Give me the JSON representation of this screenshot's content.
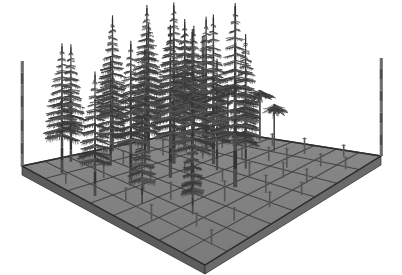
{
  "figure": {
    "background_color": "#ffffff",
    "view": "oblique / isometric-style perspective from above and in front",
    "render_style": "monochrome grayscale wireframe-shaded 3D stand model"
  },
  "colors": {
    "background": "#ffffff",
    "ground_top": "#7a7a7a",
    "ground_top_far": "#8a8a8a",
    "ground_edge_left": "#5c5c5c",
    "ground_edge_right": "#6a6a6a",
    "grid_line": "#3f3f3f",
    "plot_outline": "#2e2e2e",
    "trunk": "#4a4a4a",
    "trunk_dark": "#333333",
    "branch": "#3a3a3a",
    "branch_light": "#565656",
    "corner_post": "#6f6f6f",
    "corner_post_dark": "#4d4d4d",
    "sapling": "#555555"
  },
  "ground_plot": {
    "label": "forest ground plot",
    "shape": "square",
    "grid_columns": 8,
    "grid_rows": 8,
    "grid_cells_total": 64,
    "slab_thickness_px": 9,
    "corners_px": {
      "left": [
        22,
        166
      ],
      "top": [
        203,
        128
      ],
      "right": [
        381,
        156
      ],
      "front": [
        205,
        265
      ]
    }
  },
  "corner_posts": {
    "label": "plot corner marker posts",
    "count": 4,
    "visible_count": 3,
    "height_px": 105,
    "items": [
      {
        "name": "post-left",
        "x": 22,
        "base_y": 166,
        "height": 105
      },
      {
        "name": "post-back",
        "x": 203,
        "base_y": 128,
        "height": 92
      },
      {
        "name": "post-right",
        "x": 381,
        "base_y": 156,
        "height": 98
      }
    ]
  },
  "legend_text": [],
  "axis_labels": [],
  "chart_data": {
    "type": "scatter",
    "xlabel": "",
    "ylabel": "",
    "grid": true,
    "legend": "none",
    "height_classes": [
      {
        "class": "canopy",
        "label": "canopy conifer",
        "count": 17,
        "relative_height": 1.0
      },
      {
        "class": "sub-canopy",
        "label": "sub-canopy tree",
        "count": 9,
        "relative_height": 0.55
      },
      {
        "class": "sapling",
        "label": "sapling stem",
        "count": 34,
        "relative_height": 0.12
      }
    ],
    "trees": [
      {
        "id": 1,
        "gx": 0.1,
        "gy": 0.12,
        "height": 150,
        "crown_w": 52,
        "whorls": 15,
        "form": "conifer"
      },
      {
        "id": 2,
        "gx": 0.22,
        "gy": 0.05,
        "height": 138,
        "crown_w": 46,
        "whorls": 14,
        "form": "conifer"
      },
      {
        "id": 3,
        "gx": 0.33,
        "gy": 0.16,
        "height": 122,
        "crown_w": 42,
        "whorls": 13,
        "form": "conifer"
      },
      {
        "id": 4,
        "gx": 0.46,
        "gy": 0.04,
        "height": 158,
        "crown_w": 50,
        "whorls": 16,
        "form": "conifer"
      },
      {
        "id": 5,
        "gx": 0.56,
        "gy": 0.14,
        "height": 145,
        "crown_w": 46,
        "whorls": 15,
        "form": "conifer"
      },
      {
        "id": 6,
        "gx": 0.66,
        "gy": 0.03,
        "height": 162,
        "crown_w": 54,
        "whorls": 16,
        "form": "conifer"
      },
      {
        "id": 7,
        "gx": 0.78,
        "gy": 0.12,
        "height": 140,
        "crown_w": 48,
        "whorls": 14,
        "form": "conifer"
      },
      {
        "id": 8,
        "gx": 0.88,
        "gy": 0.07,
        "height": 128,
        "crown_w": 44,
        "whorls": 13,
        "form": "conifer"
      },
      {
        "id": 9,
        "gx": 0.06,
        "gy": 0.34,
        "height": 132,
        "crown_w": 44,
        "whorls": 13,
        "form": "conifer"
      },
      {
        "id": 10,
        "gx": 0.28,
        "gy": 0.32,
        "height": 148,
        "crown_w": 48,
        "whorls": 15,
        "form": "conifer"
      },
      {
        "id": 11,
        "gx": 0.42,
        "gy": 0.4,
        "height": 156,
        "crown_w": 50,
        "whorls": 16,
        "form": "conifer"
      },
      {
        "id": 12,
        "gx": 0.54,
        "gy": 0.3,
        "height": 170,
        "crown_w": 56,
        "whorls": 17,
        "form": "conifer"
      },
      {
        "id": 13,
        "gx": 0.64,
        "gy": 0.42,
        "height": 152,
        "crown_w": 48,
        "whorls": 15,
        "form": "conifer"
      },
      {
        "id": 14,
        "gx": 0.74,
        "gy": 0.28,
        "height": 144,
        "crown_w": 46,
        "whorls": 14,
        "form": "conifer"
      },
      {
        "id": 15,
        "gx": 0.86,
        "gy": 0.38,
        "height": 118,
        "crown_w": 40,
        "whorls": 12,
        "form": "conifer"
      },
      {
        "id": 16,
        "gx": 0.36,
        "gy": 0.58,
        "height": 160,
        "crown_w": 52,
        "whorls": 16,
        "form": "conifer"
      },
      {
        "id": 17,
        "gx": 0.52,
        "gy": 0.66,
        "height": 172,
        "crown_w": 56,
        "whorls": 17,
        "form": "conifer"
      },
      {
        "id": 18,
        "gx": 0.92,
        "gy": 0.22,
        "height": 74,
        "crown_w": 40,
        "whorls": 8,
        "form": "broad"
      },
      {
        "id": 19,
        "gx": 0.96,
        "gy": 0.36,
        "height": 66,
        "crown_w": 36,
        "whorls": 7,
        "form": "broad"
      },
      {
        "id": 20,
        "gx": 0.88,
        "gy": 0.52,
        "height": 58,
        "crown_w": 32,
        "whorls": 7,
        "form": "broad"
      },
      {
        "id": 21,
        "gx": 0.16,
        "gy": 0.5,
        "height": 86,
        "crown_w": 34,
        "whorls": 9,
        "form": "conifer"
      },
      {
        "id": 22,
        "gx": 0.68,
        "gy": 0.56,
        "height": 96,
        "crown_w": 34,
        "whorls": 10,
        "form": "conifer"
      },
      {
        "id": 23,
        "gx": 0.24,
        "gy": 0.7,
        "height": 80,
        "crown_w": 28,
        "whorls": 9,
        "form": "conifer"
      },
      {
        "id": 24,
        "gx": 0.6,
        "gy": 0.48,
        "height": 110,
        "crown_w": 38,
        "whorls": 12,
        "form": "conifer"
      },
      {
        "id": 25,
        "gx": 0.46,
        "gy": 0.22,
        "height": 126,
        "crown_w": 42,
        "whorls": 13,
        "form": "conifer"
      },
      {
        "id": 26,
        "gx": 0.72,
        "gy": 0.18,
        "height": 136,
        "crown_w": 44,
        "whorls": 14,
        "form": "conifer"
      }
    ],
    "saplings": [
      {
        "gx": 0.09,
        "gy": 0.62,
        "height": 16
      },
      {
        "gx": 0.18,
        "gy": 0.78,
        "height": 13
      },
      {
        "gx": 0.27,
        "gy": 0.55,
        "height": 18
      },
      {
        "gx": 0.31,
        "gy": 0.86,
        "height": 12
      },
      {
        "gx": 0.4,
        "gy": 0.72,
        "height": 20
      },
      {
        "gx": 0.47,
        "gy": 0.9,
        "height": 14
      },
      {
        "gx": 0.55,
        "gy": 0.8,
        "height": 17
      },
      {
        "gx": 0.62,
        "gy": 0.64,
        "height": 15
      },
      {
        "gx": 0.7,
        "gy": 0.88,
        "height": 13
      },
      {
        "gx": 0.77,
        "gy": 0.7,
        "height": 19
      },
      {
        "gx": 0.84,
        "gy": 0.82,
        "height": 12
      },
      {
        "gx": 0.91,
        "gy": 0.66,
        "height": 16
      },
      {
        "gx": 0.95,
        "gy": 0.84,
        "height": 11
      },
      {
        "gx": 0.13,
        "gy": 0.44,
        "height": 14
      },
      {
        "gx": 0.21,
        "gy": 0.24,
        "height": 17
      },
      {
        "gx": 0.35,
        "gy": 0.36,
        "height": 13
      },
      {
        "gx": 0.43,
        "gy": 0.52,
        "height": 15
      },
      {
        "gx": 0.5,
        "gy": 0.4,
        "height": 12
      },
      {
        "gx": 0.58,
        "gy": 0.2,
        "height": 18
      },
      {
        "gx": 0.66,
        "gy": 0.34,
        "height": 14
      },
      {
        "gx": 0.74,
        "gy": 0.48,
        "height": 16
      },
      {
        "gx": 0.81,
        "gy": 0.3,
        "height": 13
      },
      {
        "gx": 0.89,
        "gy": 0.14,
        "height": 15
      },
      {
        "gx": 0.04,
        "gy": 0.2,
        "height": 12
      },
      {
        "gx": 0.12,
        "gy": 0.92,
        "height": 14
      },
      {
        "gx": 0.25,
        "gy": 0.42,
        "height": 11
      },
      {
        "gx": 0.38,
        "gy": 0.18,
        "height": 16
      },
      {
        "gx": 0.53,
        "gy": 0.58,
        "height": 13
      },
      {
        "gx": 0.61,
        "gy": 0.94,
        "height": 12
      },
      {
        "gx": 0.69,
        "gy": 0.76,
        "height": 15
      },
      {
        "gx": 0.79,
        "gy": 0.58,
        "height": 14
      },
      {
        "gx": 0.86,
        "gy": 0.94,
        "height": 11
      },
      {
        "gx": 0.93,
        "gy": 0.46,
        "height": 13
      },
      {
        "gx": 0.3,
        "gy": 0.64,
        "height": 17
      }
    ]
  }
}
